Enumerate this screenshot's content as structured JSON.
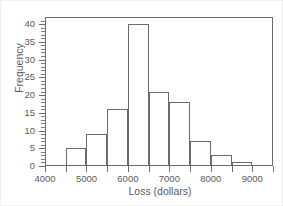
{
  "chart_data": {
    "type": "bar",
    "title": "",
    "subtitle": "",
    "xlabel": "Loss (dollars)",
    "ylabel": "Frequency",
    "bin_width": 500,
    "bin_edges": [
      4500,
      5000,
      5500,
      6000,
      6500,
      7000,
      7500,
      8000,
      8500,
      9000
    ],
    "categories": [
      "4500-5000",
      "5000-5500",
      "5500-6000",
      "6000-6500",
      "6500-7000",
      "7000-7500",
      "7500-8000",
      "8000-8500",
      "8500-9000"
    ],
    "values": [
      5,
      9,
      16,
      40,
      21,
      18,
      7,
      3,
      1
    ],
    "xlim": [
      4000,
      9500
    ],
    "ylim": [
      0,
      42
    ],
    "xticks": [
      4000,
      4500,
      5000,
      5500,
      6000,
      6500,
      7000,
      7500,
      8000,
      8500,
      9000,
      9500
    ],
    "xtick_labels": [
      {
        "value": 4000,
        "label": "4000"
      },
      {
        "value": 5000,
        "label": "5000"
      },
      {
        "value": 6000,
        "label": "6000"
      },
      {
        "value": 7000,
        "label": "7000"
      },
      {
        "value": 8000,
        "label": "8000"
      },
      {
        "value": 9000,
        "label": "9000"
      }
    ],
    "yticks": [
      0,
      5,
      10,
      15,
      20,
      25,
      30,
      35,
      40
    ],
    "ytick_labels": [
      "0",
      "5",
      "10",
      "15",
      "20",
      "25",
      "30",
      "35",
      "40"
    ],
    "grid": false,
    "legend": null,
    "annotations": [],
    "colors": {
      "bar_edge": "#6b6b6b",
      "bar_fill": "#ffffff",
      "axis": "#6b6b6b",
      "text": "#5a5a5a",
      "background": "#ffffff"
    }
  }
}
